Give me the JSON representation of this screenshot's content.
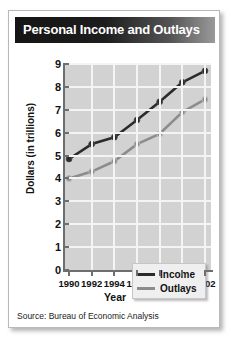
{
  "card": {
    "title": "Personal Income and Outlays",
    "source": "Source: Bureau of Economic Analysis"
  },
  "chart_data": {
    "type": "line",
    "title": "Personal Income and Outlays",
    "xlabel": "Year",
    "ylabel": "Dollars (in trillions)",
    "x": [
      1990,
      1992,
      1994,
      1996,
      1998,
      2000,
      2002
    ],
    "categories": [
      "1990",
      "1992",
      "1994",
      "1996",
      "1998",
      "2000",
      "2002"
    ],
    "series": [
      {
        "name": "Income",
        "color": "#2b2b2b",
        "values": [
          4.85,
          5.5,
          5.8,
          6.55,
          7.35,
          8.2,
          8.7
        ]
      },
      {
        "name": "Outlays",
        "color": "#8c8c8c",
        "values": [
          4.0,
          4.3,
          4.75,
          5.5,
          5.95,
          6.9,
          7.45
        ]
      }
    ],
    "ylim": [
      0,
      9
    ],
    "yticks": [
      0,
      1,
      2,
      3,
      4,
      5,
      6,
      7,
      8,
      9
    ],
    "ytick_labels": [
      "0",
      "1",
      "2",
      "3",
      "4",
      "5",
      "6",
      "7",
      "8",
      "9"
    ],
    "grid": true,
    "legend_position": "inside-bottom-right",
    "plot_background": "#d2d2d2",
    "grid_color": "#f4f4f4",
    "axis_color": "#6e6e6e"
  },
  "legend": {
    "items": [
      {
        "label": "Income",
        "color": "#2b2b2b"
      },
      {
        "label": "Outlays",
        "color": "#8c8c8c"
      }
    ]
  }
}
